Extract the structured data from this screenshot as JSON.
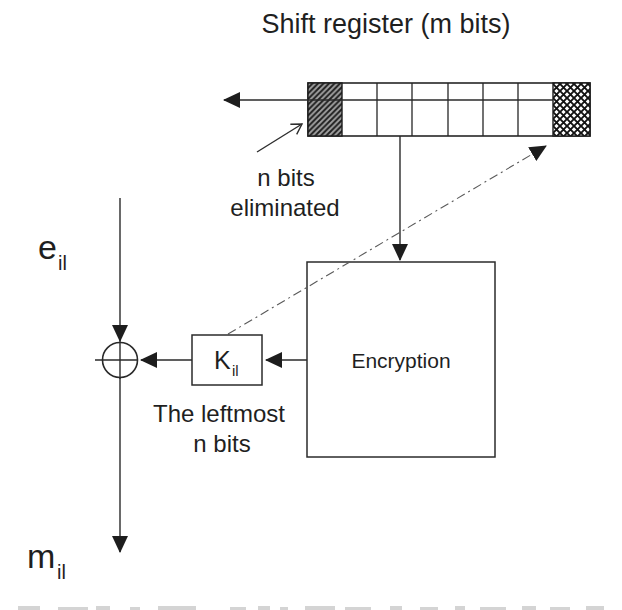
{
  "diagram": {
    "title": "Shift register (m bits)",
    "register": {
      "cells_total": 8,
      "left_cell_style": "diagonal-hatch",
      "right_cell_style": "cross-hatch"
    },
    "labels": {
      "n_bits_line1": "n bits",
      "n_bits_line2": "eliminated",
      "encryption_box": "Encryption",
      "key_box_main": "K",
      "key_box_sub": "il",
      "leftmost_line1": "The leftmost",
      "leftmost_line2": "n bits",
      "input_main": "e",
      "input_sub": "il",
      "output_main": "m",
      "output_sub": "il"
    },
    "colors": {
      "ink": "#222222",
      "background": "#ffffff",
      "dash_dot_line": "#5a5a5a",
      "hatch_fill": "#a2a2a2"
    }
  }
}
